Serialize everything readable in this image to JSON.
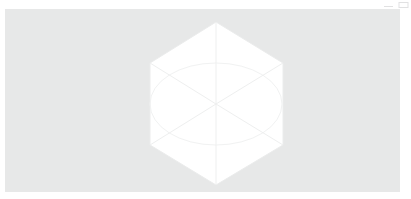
{
  "window": {
    "title": "3D Model Viewer",
    "background_color": "#ffffff"
  },
  "toolbar": {
    "buttons": [
      {
        "name": "minimize-icon",
        "label": "Minimize"
      },
      {
        "name": "maximize-icon",
        "label": "Maximize"
      }
    ]
  },
  "viewport": {
    "label": "3D Viewport",
    "background_color": "#e7e8e8",
    "bounds": {
      "x": 5,
      "y": 9,
      "width": 395,
      "height": 183
    }
  },
  "model": {
    "name": "isometric-cube",
    "shape": "hexagon",
    "fill_color": "#ffffff",
    "edge_color": "#ebecec",
    "inner_edge_color": "#eeefef",
    "arc_color": "#f0f1f1",
    "center": {
      "x": 216,
      "y": 104
    },
    "hexagon_vertices": [
      {
        "x": 216,
        "y": 22
      },
      {
        "x": 283,
        "y": 63
      },
      {
        "x": 283,
        "y": 145
      },
      {
        "x": 216,
        "y": 185
      },
      {
        "x": 150,
        "y": 145
      },
      {
        "x": 150,
        "y": 63
      }
    ],
    "spokes": [
      {
        "from": "center",
        "to": {
          "x": 216,
          "y": 22
        }
      },
      {
        "from": "center",
        "to": {
          "x": 283,
          "y": 63
        }
      },
      {
        "from": "center",
        "to": {
          "x": 283,
          "y": 145
        }
      },
      {
        "from": "center",
        "to": {
          "x": 216,
          "y": 185
        }
      },
      {
        "from": "center",
        "to": {
          "x": 150,
          "y": 145
        }
      },
      {
        "from": "center",
        "to": {
          "x": 150,
          "y": 63
        }
      }
    ],
    "arc": {
      "name": "ground-ellipse",
      "cx": 216,
      "cy": 104,
      "rx": 66,
      "ry": 41
    }
  }
}
